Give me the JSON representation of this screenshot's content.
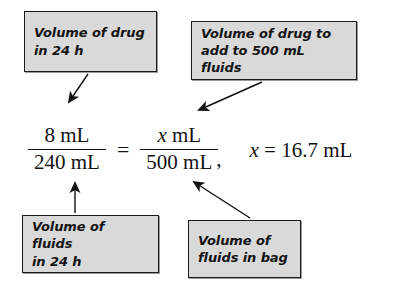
{
  "figure": {
    "background_color": "#ffffff",
    "box_fill_color": "#d9d9d9",
    "box_border_color": "#1a1a1a",
    "text_color": "#121212"
  },
  "callouts": {
    "drug_in_24h": {
      "line1": "Volume of drug",
      "line2": "in 24 h",
      "points_to": "numerator-left"
    },
    "drug_to_add": {
      "line1": "Volume of drug to",
      "line2": "add to 500 mL fluids",
      "points_to": "numerator-right"
    },
    "fluids_in_24h": {
      "line1": "Volume of fluids",
      "line2": "in 24 h",
      "points_to": "denominator-left"
    },
    "fluids_in_bag": {
      "line1": "Volume of",
      "line2": "fluids in bag",
      "points_to": "denominator-right"
    }
  },
  "equation": {
    "left_fraction": {
      "numerator": "8 mL",
      "denominator": "240 mL"
    },
    "equals": "=",
    "right_fraction": {
      "numerator_variable": "x",
      "numerator_unit": "mL",
      "denominator": "500 mL"
    },
    "comma": ",",
    "result": {
      "variable": "x",
      "equals": "=",
      "value": "16.7",
      "unit": "mL"
    }
  },
  "arrows": [
    {
      "name": "arrow-drug-24h",
      "from": [
        88,
        74
      ],
      "to": [
        67,
        104
      ]
    },
    {
      "name": "arrow-drug-to-add",
      "from": [
        262,
        82
      ],
      "to": [
        196,
        111
      ]
    },
    {
      "name": "arrow-fluids-24h",
      "from": [
        75,
        213
      ],
      "to": [
        75,
        180
      ]
    },
    {
      "name": "arrow-fluids-bag",
      "from": [
        250,
        218
      ],
      "to": [
        191,
        180
      ]
    }
  ]
}
